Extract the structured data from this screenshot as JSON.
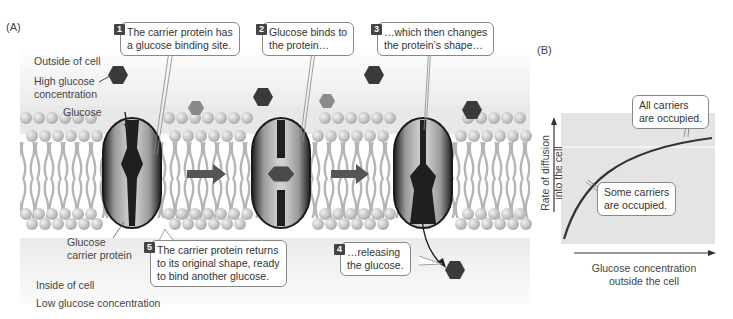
{
  "panels": {
    "a_label": "(A)",
    "b_label": "(B)"
  },
  "panel_a": {
    "outside_label": "Outside of cell",
    "high_conc_label": "High glucose\nconcentration",
    "glucose_label": "Glucose",
    "carrier_label": "Glucose\ncarrier protein",
    "inside_label": "Inside of cell",
    "low_conc_label": "Low glucose concentration",
    "steps": [
      {
        "number": "1",
        "text": "The carrier protein has\na glucose binding site."
      },
      {
        "number": "2",
        "text": "Glucose binds to\nthe protein…"
      },
      {
        "number": "3",
        "text": "…which then changes\nthe protein’s shape…"
      },
      {
        "number": "4",
        "text": "…releasing\nthe glucose."
      },
      {
        "number": "5",
        "text": "The carrier protein returns\nto its original shape, ready\nto bind another glucose."
      }
    ]
  },
  "panel_b": {
    "ylabel": "Rate of diffusion\ninto the cell",
    "xlabel": "Glucose concentration\noutside the cell",
    "annotation_high": "All carriers\nare occupied.",
    "annotation_low": "Some carriers\nare occupied."
  },
  "chart_data": {
    "type": "line",
    "title": "",
    "xlabel": "Glucose concentration outside the cell",
    "ylabel": "Rate of diffusion into the cell",
    "x": [
      0,
      1,
      2,
      3,
      4,
      5,
      6,
      7,
      8,
      9,
      10
    ],
    "series": [
      {
        "name": "Rate of diffusion",
        "values": [
          0,
          0.45,
          0.62,
          0.72,
          0.79,
          0.84,
          0.87,
          0.89,
          0.905,
          0.91,
          0.915
        ]
      }
    ],
    "annotations": [
      "All carriers are occupied.",
      "Some carriers are occupied."
    ],
    "saturation_line": 0.83,
    "axis_ticks": "none",
    "grid": false
  },
  "colors": {
    "glucose_dark": "#3a3a3a",
    "glucose_light": "#8a8a8a",
    "membrane_head": "#d6d6d6",
    "protein": "#2a2a2a",
    "chart_bg": "#e4e4e4"
  }
}
